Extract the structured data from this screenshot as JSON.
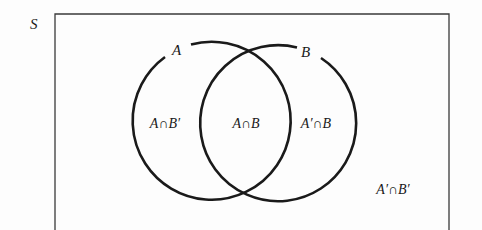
{
  "diagram": {
    "type": "venn",
    "universe": {
      "label": "S"
    },
    "sets": [
      {
        "label": "A"
      },
      {
        "label": "B"
      }
    ],
    "regions": {
      "a_only": "A∩B′",
      "both": "A∩B",
      "b_only": "A′∩B",
      "neither": "A′∩B′"
    },
    "colors": {
      "stroke": "#1a1a1a",
      "background": "#fdfdfd"
    }
  }
}
